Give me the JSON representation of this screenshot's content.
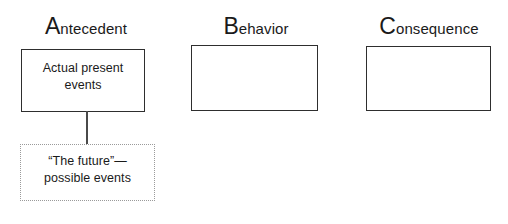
{
  "diagram": {
    "columns": [
      {
        "id": "antecedent",
        "cap": "A",
        "rest": "ntecedent",
        "box_text": "Actual present\nevents",
        "box_style": "solid",
        "box_border_color": "#2e2e2e"
      },
      {
        "id": "behavior",
        "cap": "B",
        "rest": "ehavior",
        "box_text": "",
        "box_style": "solid",
        "box_border_color": "#2e2e2e"
      },
      {
        "id": "consequence",
        "cap": "C",
        "rest": "onsequence",
        "box_text": "",
        "box_style": "solid",
        "box_border_color": "#2e2e2e"
      }
    ],
    "future_box": {
      "id": "future",
      "text": "“The future”—\npossible events",
      "box_style": "dotted",
      "box_border_color": "#9a9a9a"
    },
    "connector": {
      "from": "antecedent",
      "to": "future",
      "color": "#4a4a4a"
    },
    "background_color": "#ffffff",
    "text_color": "#1a1a1a"
  }
}
